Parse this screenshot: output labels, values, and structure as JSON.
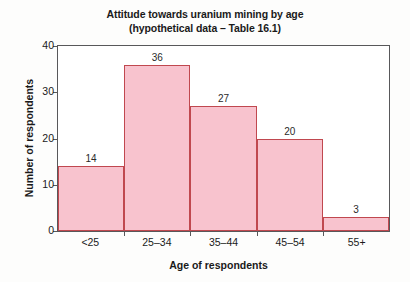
{
  "chart_data": {
    "type": "bar",
    "title": "Attitude towards uranium mining by age\n(hypothetical data – Table 16.1)",
    "title_lines": [
      "Attitude towards uranium mining by age",
      "(hypothetical data – Table 16.1)"
    ],
    "xlabel": "Age of respondents",
    "ylabel": "Number of respondents",
    "categories": [
      "<25",
      "25–34",
      "35–44",
      "45–54",
      "55+"
    ],
    "values": [
      14,
      36,
      27,
      20,
      3
    ],
    "data_labels": [
      "14",
      "36",
      "27",
      "20",
      "3"
    ],
    "ylim": [
      0,
      40
    ],
    "yticks": [
      0,
      10,
      20,
      30,
      40
    ],
    "ytick_labels": [
      "0",
      "10",
      "20",
      "30",
      "40"
    ],
    "grid": false,
    "legend": null,
    "bar_gap": 0,
    "colors": {
      "bar_fill": "#f8c3ce",
      "bar_edge": "#c0484f",
      "axis": "#58585a",
      "text": "#1a1a1a",
      "plot_background": "#ffffff",
      "figure_background": "#fdfdfc"
    }
  }
}
